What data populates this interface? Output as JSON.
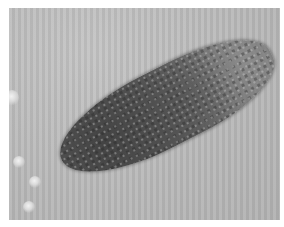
{
  "image": {
    "description": "Grayscale light-microscopy image of an elongated, dark, granular cell cluster lying diagonally on a striped gray background with faint bright bubbles along the left edge",
    "colors": {
      "background": "#b9b9b9",
      "specimen_dark": "#4a4a4a",
      "specimen_light": "#9c9c9c",
      "border": "#ffffff"
    }
  }
}
